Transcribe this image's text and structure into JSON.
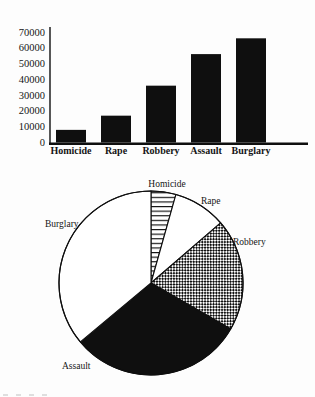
{
  "colors": {
    "ink": "#0f0f0f",
    "paper": "#fdfdfd",
    "bar_fill": "#0f0f0f"
  },
  "chart_data": [
    {
      "type": "bar",
      "title": "",
      "xlabel": "",
      "ylabel": "",
      "categories": [
        "Homicide",
        "Rape",
        "Robbery",
        "Assault",
        "Burglary"
      ],
      "values": [
        8000,
        17000,
        36000,
        56000,
        66000
      ],
      "ylim": [
        0,
        70000
      ],
      "yticks": [
        0,
        10000,
        20000,
        30000,
        40000,
        50000,
        60000,
        70000
      ],
      "grid": false,
      "legend": "none",
      "bar_color": "#0f0f0f"
    },
    {
      "type": "pie",
      "title": "",
      "categories": [
        "Homicide",
        "Rape",
        "Robbery",
        "Assault",
        "Burglary"
      ],
      "values": [
        8000,
        17000,
        36000,
        56000,
        66000
      ],
      "percentages": [
        4.4,
        9.3,
        19.7,
        30.6,
        36.1
      ],
      "start_angle_deg": 0,
      "direction": "clockwise",
      "slice_styles": [
        "horizontal-lines",
        "white",
        "diagonal-weave",
        "solid-black",
        "white"
      ],
      "label_position": "outside",
      "legend": "none"
    }
  ]
}
